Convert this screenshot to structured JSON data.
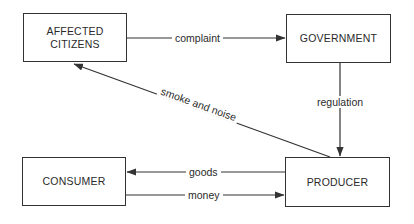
{
  "nodes": {
    "affected_citizens": {
      "line1": "AFFECTED",
      "line2": "CITIZENS"
    },
    "government": {
      "label": "GOVERNMENT"
    },
    "consumer": {
      "label": "CONSUMER"
    },
    "producer": {
      "label": "PRODUCER"
    }
  },
  "edges": {
    "complaint": {
      "label": "complaint",
      "from": "AFFECTED CITIZENS",
      "to": "GOVERNMENT"
    },
    "regulation": {
      "label": "regulation",
      "from": "GOVERNMENT",
      "to": "PRODUCER"
    },
    "smoke_noise": {
      "label": "smoke and noise",
      "from": "PRODUCER",
      "to": "AFFECTED CITIZENS"
    },
    "goods": {
      "label": "goods",
      "from": "PRODUCER",
      "to": "CONSUMER"
    },
    "money": {
      "label": "money",
      "from": "CONSUMER",
      "to": "PRODUCER"
    }
  }
}
